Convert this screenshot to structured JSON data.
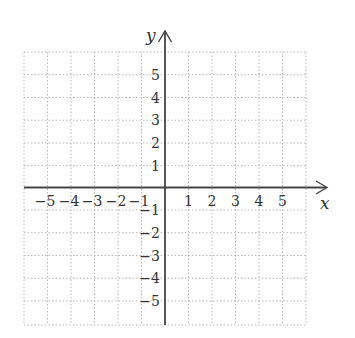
{
  "diagram": {
    "type": "coordinate-plane",
    "x_axis_label": "x",
    "y_axis_label": "y",
    "x_range": [
      -6,
      6
    ],
    "y_range": [
      -6,
      6
    ],
    "x_ticks_negative": [
      "−5",
      "−4",
      "−3",
      "−2",
      "−1"
    ],
    "x_ticks_positive": [
      "1",
      "2",
      "3",
      "4",
      "5"
    ],
    "y_ticks_positive": [
      "5",
      "4",
      "3",
      "2",
      "1"
    ],
    "y_ticks_negative": [
      "−1",
      "−2",
      "−3",
      "−4",
      "−5"
    ],
    "grid_style": "dotted",
    "colors": {
      "axis": "#444444",
      "grid": "#b8b8b8",
      "text": "#333333"
    }
  }
}
